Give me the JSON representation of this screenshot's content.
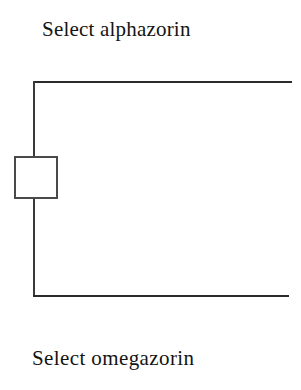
{
  "page": {
    "background_color": "#ffffff",
    "ink_color": "#2b2b2b",
    "width": 301,
    "height": 390
  },
  "labels": {
    "top": "Select alphazorin",
    "bottom": "Select omegazorin"
  },
  "figure": {
    "name": "bracket-with-node",
    "node": {
      "shape": "square",
      "fill": "#ffffff",
      "stroke": "#4a4a4a",
      "position": "midpoint-of-left-spine"
    },
    "arms": {
      "top_label_ref": "Select alphazorin",
      "bottom_label_ref": "Select omegazorin"
    }
  }
}
